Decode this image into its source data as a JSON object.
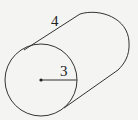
{
  "diagram": {
    "type": "cylinder",
    "labels": {
      "length": "4",
      "radius": "3"
    },
    "colors": {
      "stroke": "#333333",
      "background": "#f4f4f2"
    }
  }
}
